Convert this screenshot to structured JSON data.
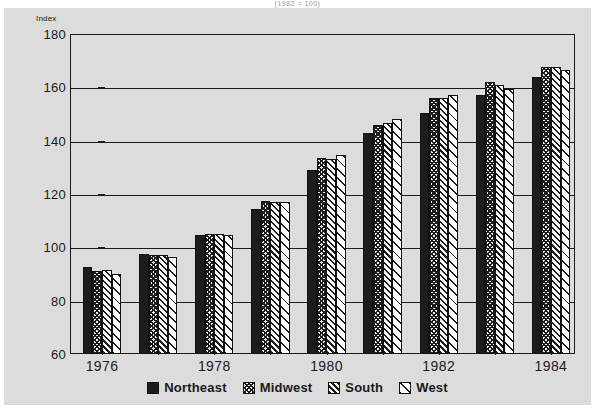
{
  "top_clipped_text": "(1982 = 100)",
  "axis": {
    "y_axis_title": "Index",
    "y_ticks": [
      180,
      160,
      140,
      120,
      100,
      80,
      60
    ],
    "y_min": 60,
    "y_max": 180,
    "x_tick_labels": [
      "1976",
      "1978",
      "1980",
      "1982",
      "1984"
    ]
  },
  "legend": {
    "items": [
      {
        "label": "Northeast",
        "pattern": "solid-dark-swatch"
      },
      {
        "label": "Midwest",
        "pattern": "dense-crosshatch-swatch"
      },
      {
        "label": "South",
        "pattern": "diagonal-hatch-swatch"
      },
      {
        "label": "West",
        "pattern": "sparse-diagonal-hatch-swatch"
      }
    ]
  },
  "colors": {
    "page_background": "#ffffff",
    "panel_background": "#dcdcdc",
    "ink": "#1a1a1a",
    "bar_dark": "#1c1c1c",
    "bar_light": "#ffffff"
  },
  "chart_data": {
    "type": "bar",
    "title": "",
    "xlabel": "",
    "ylabel": "Index",
    "ylim": [
      60,
      180
    ],
    "grid": true,
    "legend_position": "bottom",
    "categories": [
      "1976",
      "1977",
      "1978",
      "1979",
      "1980",
      "1981",
      "1982",
      "1983",
      "1984"
    ],
    "tick_label_every": 2,
    "series": [
      {
        "name": "Northeast",
        "values": [
          92.5,
          97.5,
          104.5,
          114.5,
          129.0,
          143.0,
          150.5,
          157.0,
          164.0
        ]
      },
      {
        "name": "Midwest",
        "values": [
          91.0,
          97.0,
          105.0,
          117.5,
          133.5,
          146.0,
          156.0,
          162.0,
          167.5
        ]
      },
      {
        "name": "South",
        "values": [
          91.5,
          97.0,
          105.0,
          117.0,
          133.0,
          146.5,
          156.0,
          161.0,
          167.5
        ]
      },
      {
        "name": "West",
        "values": [
          90.0,
          96.5,
          104.5,
          117.0,
          134.5,
          148.0,
          157.0,
          159.5,
          166.5
        ]
      }
    ]
  }
}
